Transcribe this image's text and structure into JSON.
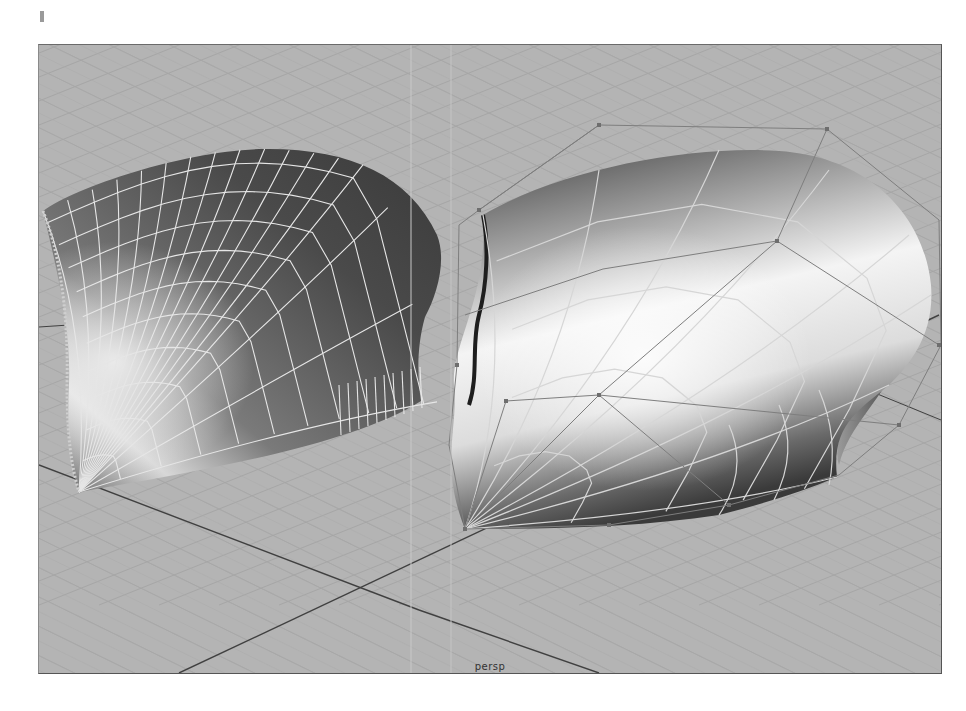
{
  "viewport": {
    "camera_label": "persp",
    "background_color": "#b4b4b4",
    "grid_color": "#a2a2a2",
    "axis_color": "#404040",
    "wireframe_color": "#e8e8e8",
    "hull_color": "#8c8c8c"
  },
  "objects": [
    {
      "name": "nurbs-surface-isoparms",
      "display": "shaded-with-isoparms"
    },
    {
      "name": "nurbs-surface-hull",
      "display": "shaded-with-hull"
    }
  ]
}
